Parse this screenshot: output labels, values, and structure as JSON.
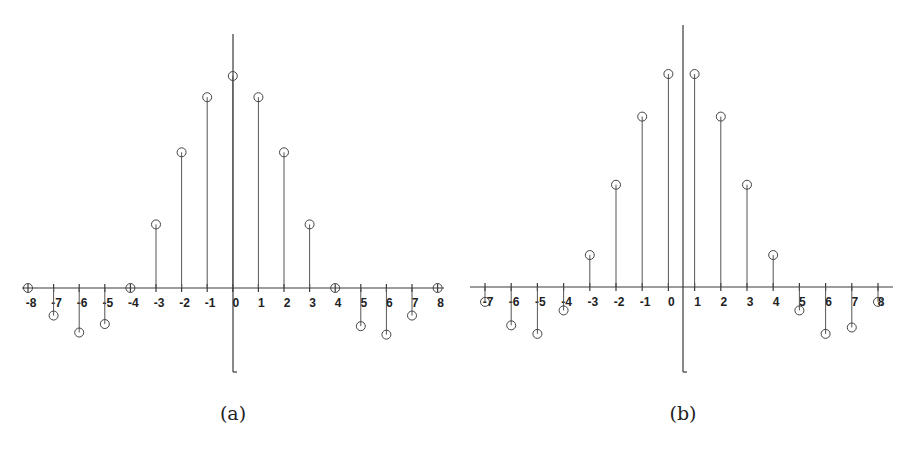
{
  "chart_data": [
    {
      "type": "stem",
      "panel": "a",
      "caption": "(a)",
      "title": "",
      "xlabel": "",
      "ylabel": "",
      "grid": false,
      "xlim": [
        -8,
        8
      ],
      "x_ticks": [
        -8,
        -7,
        -6,
        -5,
        -4,
        -3,
        -2,
        -1,
        0,
        1,
        2,
        3,
        4,
        5,
        6,
        7,
        8
      ],
      "x": [
        -8,
        -7,
        -6,
        -5,
        -4,
        -3,
        -2,
        -1,
        0,
        1,
        2,
        3,
        4,
        5,
        6,
        7,
        8
      ],
      "values": [
        0,
        -0.13,
        -0.21,
        -0.17,
        0,
        0.3,
        0.64,
        0.9,
        1.0,
        0.9,
        0.64,
        0.3,
        0,
        -0.18,
        -0.22,
        -0.13,
        0
      ],
      "y_axis_x": 0,
      "geom": {
        "x0": 28,
        "unit": 25.6,
        "axis_y": 288,
        "scale": 212,
        "vaxis_x": 233,
        "vaxis_top": 34,
        "vaxis_bottom": 372,
        "haxis_left": 22,
        "haxis_right": 444
      }
    },
    {
      "type": "stem",
      "panel": "b",
      "caption": "(b)",
      "title": "",
      "xlabel": "",
      "ylabel": "",
      "grid": false,
      "xlim": [
        -7,
        8
      ],
      "x_ticks": [
        -7,
        -6,
        -5,
        -4,
        -3,
        -2,
        -1,
        0,
        1,
        2,
        3,
        4,
        5,
        6,
        7,
        8
      ],
      "x": [
        -7,
        -6,
        -5,
        -4,
        -3,
        -2,
        -1,
        0,
        1,
        2,
        3,
        4,
        5,
        6,
        7,
        8
      ],
      "values": [
        -0.07,
        -0.18,
        -0.22,
        -0.11,
        0.15,
        0.48,
        0.8,
        1.0,
        1.0,
        0.8,
        0.48,
        0.15,
        -0.11,
        -0.22,
        -0.19,
        -0.07
      ],
      "y_axis_x": 0.5,
      "geom": {
        "x0": 485,
        "unit": 26.2,
        "axis_y": 287,
        "scale": 213,
        "vaxis_x": 683,
        "vaxis_top": 25,
        "vaxis_bottom": 372,
        "haxis_left": 470,
        "haxis_right": 893
      }
    }
  ]
}
